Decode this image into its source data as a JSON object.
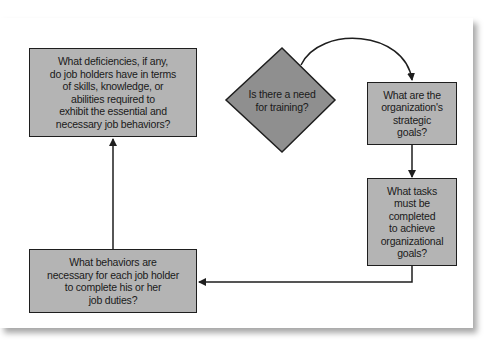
{
  "diagram": {
    "type": "flowchart",
    "colors": {
      "box_fill": "#b4b4b4",
      "diamond_fill": "#8f8f8f",
      "stroke": "#1e1e1e",
      "background": "#ffffff"
    },
    "nodes": {
      "start": {
        "shape": "diamond",
        "label": "Is there a need\nfor training?"
      },
      "strategic_goals": {
        "shape": "box",
        "label": "What are the\norganization's\nstrategic\ngoals?"
      },
      "tasks": {
        "shape": "box",
        "label": "What tasks\nmust be\ncompleted\nto achieve\norganizational\ngoals?"
      },
      "behaviors": {
        "shape": "box",
        "label": "What behaviors are\nnecessary for each job holder\nto complete his or her\njob duties?"
      },
      "deficiencies": {
        "shape": "box",
        "label": "What deficiencies, if any,\ndo job holders have in terms\nof skills, knowledge, or\nabilities required to\nexhibit the essential and\nnecessary job behaviors?"
      }
    },
    "edges": [
      {
        "from": "start",
        "to": "strategic_goals",
        "style": "curved-arrow"
      },
      {
        "from": "strategic_goals",
        "to": "tasks",
        "style": "arrow"
      },
      {
        "from": "tasks",
        "to": "behaviors",
        "style": "elbow-arrow"
      },
      {
        "from": "behaviors",
        "to": "deficiencies",
        "style": "arrow"
      }
    ]
  }
}
